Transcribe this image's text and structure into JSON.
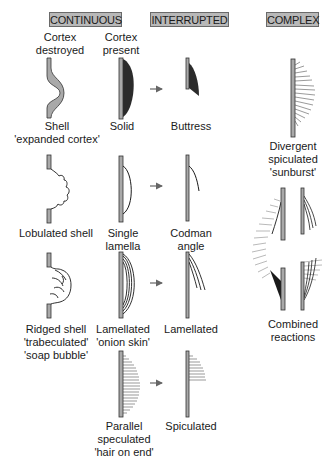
{
  "headers": {
    "continuous": "CONTINUOUS",
    "interrupted": "INTERRUPTED",
    "complex": "COMPLEX"
  },
  "continuous": {
    "cortex_destroyed_title": [
      "Cortex",
      "destroyed"
    ],
    "cortex_present_title": [
      "Cortex",
      "present"
    ],
    "items": [
      {
        "name": "shell",
        "label": [
          "Shell",
          "'expanded cortex'"
        ]
      },
      {
        "name": "solid",
        "label": [
          "Solid"
        ]
      },
      {
        "name": "lobulated-shell",
        "label": [
          "Lobulated shell"
        ]
      },
      {
        "name": "single-lamella",
        "label": [
          "Single",
          "lamella"
        ]
      },
      {
        "name": "ridged-shell",
        "label": [
          "Ridged shell",
          "'trabeculated'",
          "'soap bubble'"
        ]
      },
      {
        "name": "lamellated-onion-skin",
        "label": [
          "Lamellated",
          "'onion skin'"
        ]
      },
      {
        "name": "parallel-speculated",
        "label": [
          "Parallel",
          "speculated",
          "'hair on end'"
        ]
      }
    ]
  },
  "interrupted": {
    "items": [
      {
        "name": "buttress",
        "label": [
          "Buttress"
        ]
      },
      {
        "name": "codman-angle",
        "label": [
          "Codman",
          "angle"
        ]
      },
      {
        "name": "lamellated",
        "label": [
          "Lamellated"
        ]
      },
      {
        "name": "spiculated",
        "label": [
          "Spiculated"
        ]
      }
    ]
  },
  "complex": {
    "items": [
      {
        "name": "divergent-spiculated",
        "label": [
          "Divergent",
          "spiculated",
          "'sunburst'"
        ]
      },
      {
        "name": "combined-reactions",
        "label": [
          "Combined",
          "reactions"
        ]
      }
    ]
  },
  "colors": {
    "header_fill": "#b8b8b8",
    "cortex_fill": "#a9a9a9",
    "solid_fill": "#2b2b2b",
    "line": "#1a1a1a",
    "spicule": "#6e6e6e",
    "arrow": "#666666"
  }
}
